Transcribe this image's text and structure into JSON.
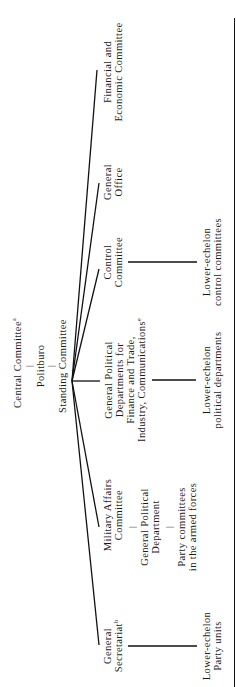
{
  "diagram": {
    "type": "organizational-chart",
    "orientation": "rotated -90deg",
    "root_stack": {
      "central_committee": "Central Committee",
      "central_committee_note": "a",
      "politburo": "Politburo",
      "standing_committee": "Standing Committee"
    },
    "branches": {
      "financial": {
        "line1": "Financial and",
        "line2": "Economic Committee"
      },
      "general_office": {
        "line1": "General",
        "line2": "Office"
      },
      "control": {
        "line1": "Control",
        "line2": "Committee",
        "sub": {
          "line1": "Lower-echelon",
          "line2": "control committees"
        }
      },
      "political_departments": {
        "line1": "General Political",
        "line2": "Departments for",
        "line3": "Finance and Trade,",
        "line4": "Industry, Communications",
        "line4_note": "e",
        "sub": {
          "line1": "Lower-echelon",
          "line2": "political departments"
        }
      },
      "military": {
        "line1": "Military Affairs",
        "line2": "Committee",
        "gpd": {
          "line1": "General Political",
          "line2": "Department"
        },
        "party": {
          "line1": "Party committees",
          "line2": "in the armed forces"
        }
      },
      "secretariat": {
        "line1": "General",
        "line2": "Secretariat",
        "line2_note": "b",
        "sub": {
          "line1": "Lower-echelon",
          "line2": "Party units"
        }
      }
    },
    "tick": "|"
  }
}
